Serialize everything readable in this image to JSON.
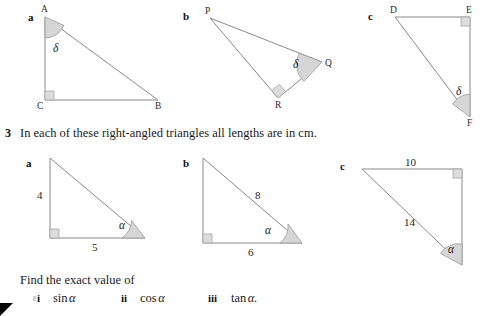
{
  "worksheet": {
    "question_number": "3",
    "question_text": "In each of these right-angled triangles all lengths are in cm.",
    "find_text": "Find the exact value of",
    "subparts": [
      {
        "numeral": "i",
        "expression": "sin",
        "variable": "α"
      },
      {
        "numeral": "ii",
        "expression": "cos",
        "variable": "α"
      },
      {
        "numeral": "iii",
        "expression": "tan",
        "variable": "α."
      }
    ]
  },
  "colors": {
    "line": "#8a8a8a",
    "angle_fill": "#d6d6d6",
    "angle_stroke": "#9a9a9a",
    "right_angle_fill": "#dcdcdc",
    "right_angle_stroke": "#a8a8a8",
    "text": "#1b1b1b",
    "marker": "#000000"
  },
  "top_row": {
    "label": "top-row-triangles",
    "items": [
      {
        "letter": "a",
        "name": "triangle-abc",
        "vertices": [
          {
            "name": "A",
            "position": "top-left"
          },
          {
            "name": "C",
            "position": "bottom-left"
          },
          {
            "name": "B",
            "position": "bottom-right"
          }
        ],
        "angle_label": "δ",
        "angle_at": "A",
        "right_angle_at": "C"
      },
      {
        "letter": "b",
        "name": "triangle-pqr",
        "vertices": [
          {
            "name": "P",
            "position": "top-left"
          },
          {
            "name": "Q",
            "position": "right"
          },
          {
            "name": "R",
            "position": "bottom"
          }
        ],
        "angle_label": "δ",
        "angle_at": "Q",
        "right_angle_at": "R"
      },
      {
        "letter": "c",
        "name": "triangle-def",
        "vertices": [
          {
            "name": "D",
            "position": "top-left"
          },
          {
            "name": "E",
            "position": "top-right"
          },
          {
            "name": "F",
            "position": "bottom-right"
          }
        ],
        "angle_label": "δ",
        "angle_at": "F",
        "right_angle_at": "E"
      }
    ]
  },
  "bottom_row": {
    "label": "bottom-row-triangles",
    "items": [
      {
        "letter": "a",
        "name": "triangle-3a",
        "angle_label": "α",
        "side_labels": [
          {
            "name": "vertical-side",
            "value": "4"
          },
          {
            "name": "horizontal-side",
            "value": "5"
          }
        ],
        "right_angle_at": "bottom-left"
      },
      {
        "letter": "b",
        "name": "triangle-3b",
        "angle_label": "α",
        "side_labels": [
          {
            "name": "hypotenuse",
            "value": "8"
          },
          {
            "name": "horizontal-side",
            "value": "6"
          }
        ],
        "right_angle_at": "bottom-left"
      },
      {
        "letter": "c",
        "name": "triangle-3c",
        "angle_label": "α",
        "side_labels": [
          {
            "name": "horizontal-side",
            "value": "10"
          },
          {
            "name": "hypotenuse",
            "value": "14"
          }
        ],
        "right_angle_at": "top-right"
      }
    ]
  }
}
